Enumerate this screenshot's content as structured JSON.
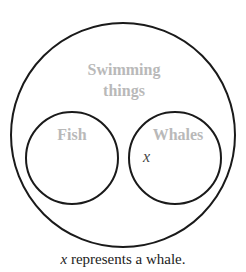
{
  "diagram": {
    "outer_set": {
      "label_line1": "Swimming",
      "label_line2": "things"
    },
    "left_set": {
      "label": "Fish"
    },
    "right_set": {
      "label": "Whales"
    },
    "element": {
      "symbol": "x",
      "in_set": "Whales"
    },
    "caption": {
      "variable": "x",
      "text": " represents a whale."
    },
    "colors": {
      "stroke": "#1a1a1a",
      "label": "#b9b9b9",
      "element": "#444444"
    }
  }
}
